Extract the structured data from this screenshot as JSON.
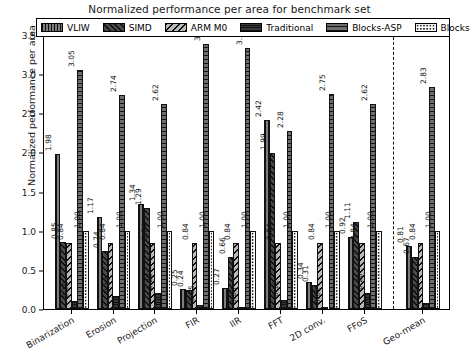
{
  "chart_data": {
    "type": "bar",
    "title": "Normalized performance per area for benchmark set",
    "xlabel": "",
    "ylabel": "Normalized performance per area",
    "ylim": [
      0,
      3.5
    ],
    "yticks": [
      "0.0",
      "0.5",
      "1.0",
      "1.5",
      "2.0",
      "2.5",
      "3.0",
      "3.5"
    ],
    "grid": false,
    "legend_position": "upper center",
    "categories": [
      "Binarization",
      "Erosion",
      "Projection",
      "FIR",
      "IIR",
      "FFT",
      "2D conv.",
      "FFoS",
      "Geo-mean"
    ],
    "separator_after_category": "FFoS",
    "series": [
      {
        "name": "VLIW",
        "pattern": "vertical-lines",
        "values": [
          1.98,
          1.17,
          1.34,
          0.25,
          0.27,
          2.42,
          0.34,
          0.92,
          0.81
        ]
      },
      {
        "name": "SIMD",
        "pattern": "back-hatch",
        "values": [
          0.85,
          0.74,
          1.29,
          0.24,
          0.66,
          1.99,
          0.31,
          1.11,
          0.67
        ]
      },
      {
        "name": "ARM M0",
        "pattern": "forward-hatch",
        "values": [
          0.84,
          0.84,
          0.84,
          0.84,
          0.84,
          0.84,
          0.84,
          0.84,
          0.84
        ]
      },
      {
        "name": "Traditional",
        "pattern": "horizontal-dense",
        "values": [
          0.1,
          0.17,
          0.2,
          0.05,
          0.03,
          0.12,
          0.02,
          0.2,
          0.08
        ]
      },
      {
        "name": "Blocks-ASP",
        "pattern": "horizontal-lines",
        "values": [
          3.05,
          2.74,
          2.62,
          3.38,
          3.34,
          2.28,
          2.75,
          2.62,
          2.83
        ]
      },
      {
        "name": "Blocks",
        "pattern": "dotted",
        "values": [
          1.0,
          1.0,
          1.0,
          1.0,
          1.0,
          1.0,
          1.0,
          1.0,
          1.0
        ]
      }
    ]
  }
}
